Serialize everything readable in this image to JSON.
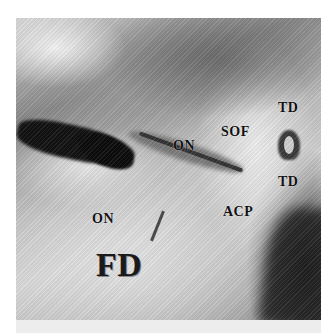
{
  "figure": {
    "labels": {
      "td_top": "TD",
      "sof": "SOF",
      "on_top": "ON",
      "td_mid": "TD",
      "acp": "ACP",
      "on_left": "ON",
      "fd": "FD"
    }
  }
}
